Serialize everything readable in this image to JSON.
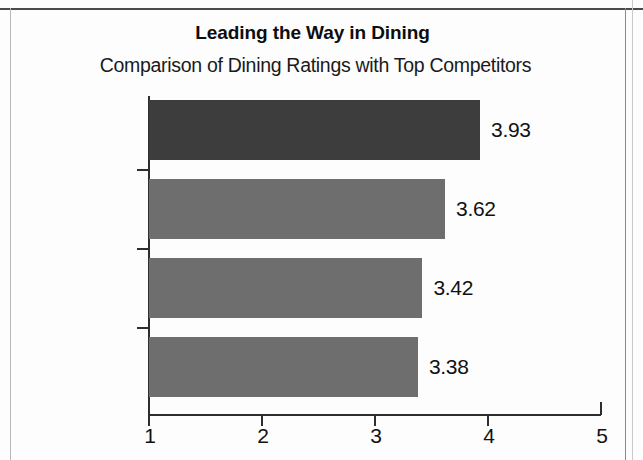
{
  "chart_data": {
    "type": "bar",
    "orientation": "horizontal",
    "title": "Leading the Way in Dining",
    "subtitle": "Comparison of Dining Ratings with Top Competitors",
    "xlabel": "",
    "ylabel": "",
    "categories": [
      "Prestigio",
      "Great Falls",
      "Grand Swan",
      "Wyatt"
    ],
    "values": [
      3.93,
      3.62,
      3.42,
      3.38
    ],
    "value_labels": [
      "3.93",
      "3.62",
      "3.42",
      "3.38"
    ],
    "xlim": [
      1,
      5
    ],
    "xticks": [
      1,
      2,
      3,
      4,
      5
    ],
    "xtick_labels": [
      "1",
      "2",
      "3",
      "4",
      "5"
    ],
    "grid": false,
    "legend": false,
    "bar_colors": [
      "#3d3d3d",
      "#6e6e6e",
      "#6e6e6e",
      "#6e6e6e"
    ],
    "highlight_category": "Prestigio",
    "colors": {
      "highlight_bar": "#3d3d3d",
      "competitor_bar": "#6e6e6e",
      "axis": "#2e2e2e",
      "text": "#111111",
      "background": "#fdfdfd"
    }
  }
}
